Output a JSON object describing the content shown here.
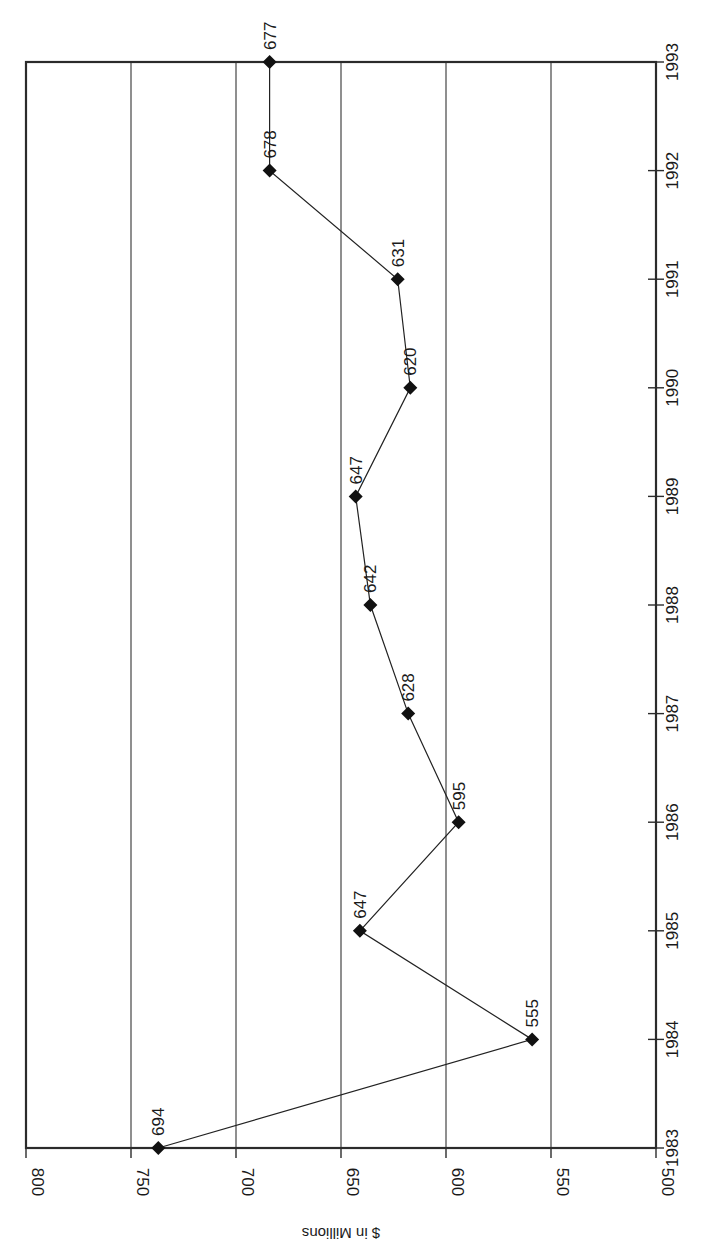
{
  "chart_data": {
    "type": "line",
    "orientation": "rotated 90 degrees clockwise (year axis runs vertically, value axis horizontally)",
    "title": "",
    "xlabel": "",
    "ylabel": "$ in Millions",
    "categories": [
      "1983",
      "1984",
      "1985",
      "1986",
      "1987",
      "1988",
      "1989",
      "1990",
      "1991",
      "1992",
      "1993"
    ],
    "series": [
      {
        "name": "$ in Millions",
        "values": [
          694,
          555,
          647,
          595,
          628,
          642,
          647,
          620,
          631,
          678,
          677
        ],
        "data_labels": [
          "694",
          "555",
          "647",
          "595",
          "628",
          "642",
          "647",
          "620",
          "631",
          "678",
          "677"
        ],
        "plotted_positions_on_axis": [
          737,
          559,
          641,
          594,
          618,
          636,
          643,
          617,
          623,
          684,
          684
        ],
        "marker": "diamond",
        "color": "#111111"
      }
    ],
    "value_axis": {
      "label": "$ in Millions",
      "ticks": [
        800,
        750,
        700,
        650,
        600,
        550,
        500
      ],
      "tick_labels": [
        "800",
        "750",
        "700",
        "650",
        "600",
        "550",
        "500"
      ],
      "range": [
        500,
        800
      ]
    },
    "category_axis": {
      "ticks": [
        "1983",
        "1984",
        "1985",
        "1986",
        "1987",
        "1988",
        "1989",
        "1990",
        "1991",
        "1992",
        "1993"
      ]
    },
    "ylim": [
      500,
      800
    ],
    "grid": true,
    "legend": "none",
    "note": "Printed data labels do not match the marker positions on the value axis in the source figure; 'values' holds the printed labels and 'plotted_positions_on_axis' holds the positions read off the axis."
  },
  "colors": {
    "background": "#ffffff",
    "axis": "#2b2b2b",
    "grid": "#333333",
    "line": "#222222",
    "marker": "#111111",
    "text": "#1a1a1a"
  }
}
